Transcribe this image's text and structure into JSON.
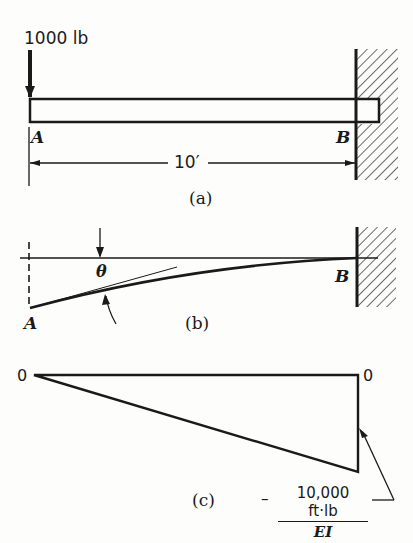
{
  "figure_a": {
    "load_label": "1000 lb",
    "point_a": "A",
    "point_b": "B",
    "span_label": "10′",
    "caption": "(a)"
  },
  "figure_b": {
    "angle_label": "θ",
    "point_a": "A",
    "point_b": "B",
    "caption": "(b)"
  },
  "figure_c": {
    "left_value": "0",
    "right_value": "0",
    "moment_numerator": "10,000 ft·lb",
    "moment_denominator": "EI",
    "moment_sign": "–",
    "caption": "(c)"
  },
  "colors": {
    "ink": "#1a1a1a",
    "paper": "#fdfdfb"
  }
}
